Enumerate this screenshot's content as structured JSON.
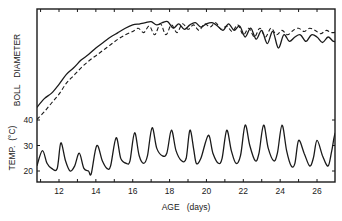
{
  "chart_data": {
    "type": "line",
    "title": "",
    "xlabel": "AGE (days)",
    "ylabel_upper": "BOLL DIAMETER",
    "ylabel_lower": "TEMP. (°C)",
    "xlim": [
      10.8,
      27.2
    ],
    "x_ticks": [
      12,
      14,
      16,
      18,
      20,
      22,
      24,
      26
    ],
    "y_ticks_temp": [
      20,
      30,
      40
    ],
    "grid": false,
    "legend": "none",
    "series": [
      {
        "name": "Boll diameter (solid)",
        "style": "solid",
        "units": "relative (unlabeled axis, 0-1 of upper panel)",
        "x": [
          10.8,
          11.2,
          11.6,
          12.0,
          12.4,
          12.8,
          13.2,
          13.6,
          14.0,
          14.4,
          14.8,
          15.2,
          15.6,
          16.0,
          16.4,
          16.7,
          17.0,
          17.3,
          17.6,
          17.9,
          18.2,
          18.5,
          18.8,
          19.1,
          19.4,
          19.7,
          20.0,
          20.3,
          20.6,
          20.9,
          21.2,
          21.5,
          21.8,
          22.1,
          22.4,
          22.7,
          23.0,
          23.3,
          23.6,
          23.9,
          24.2,
          24.5,
          24.8,
          25.1,
          25.4,
          25.7,
          26.0,
          26.3,
          26.6,
          26.9,
          27.2
        ],
        "y": [
          0.16,
          0.24,
          0.29,
          0.37,
          0.46,
          0.52,
          0.59,
          0.64,
          0.7,
          0.75,
          0.8,
          0.84,
          0.88,
          0.91,
          0.92,
          0.93,
          0.94,
          0.91,
          0.93,
          0.94,
          0.88,
          0.92,
          0.87,
          0.91,
          0.93,
          0.89,
          0.92,
          0.93,
          0.9,
          0.86,
          0.92,
          0.86,
          0.9,
          0.8,
          0.88,
          0.78,
          0.86,
          0.74,
          0.85,
          0.7,
          0.82,
          0.76,
          0.8,
          0.82,
          0.76,
          0.82,
          0.8,
          0.75,
          0.8,
          0.76,
          0.77
        ]
      },
      {
        "name": "Boll diameter (dashed)",
        "style": "dashed",
        "units": "relative (unlabeled axis, 0-1 of upper panel)",
        "x": [
          10.8,
          11.2,
          11.6,
          12.0,
          12.4,
          12.8,
          13.2,
          13.6,
          14.0,
          14.4,
          14.8,
          15.2,
          15.6,
          16.0,
          16.3,
          16.6,
          16.9,
          17.2,
          17.5,
          17.8,
          18.1,
          18.4,
          18.7,
          19.0,
          19.3,
          19.6,
          19.9,
          20.2,
          20.5,
          20.8,
          21.1,
          21.4,
          21.7,
          22.0,
          22.3,
          22.6,
          22.9,
          23.2,
          23.5,
          23.8,
          24.1,
          24.4,
          24.7,
          25.0,
          25.3,
          25.6,
          25.9,
          26.2,
          26.5,
          26.8,
          27.2
        ],
        "y": [
          0.05,
          0.12,
          0.2,
          0.28,
          0.38,
          0.45,
          0.52,
          0.58,
          0.63,
          0.68,
          0.73,
          0.78,
          0.82,
          0.85,
          0.88,
          0.84,
          0.9,
          0.82,
          0.92,
          0.82,
          0.91,
          0.84,
          0.92,
          0.87,
          0.91,
          0.86,
          0.92,
          0.89,
          0.93,
          0.87,
          0.9,
          0.85,
          0.91,
          0.82,
          0.88,
          0.8,
          0.88,
          0.8,
          0.88,
          0.82,
          0.86,
          0.82,
          0.86,
          0.88,
          0.85,
          0.88,
          0.86,
          0.83,
          0.86,
          0.84,
          0.85
        ]
      },
      {
        "name": "Temperature",
        "style": "solid",
        "units": "°C",
        "x": [
          10.8,
          11.1,
          11.35,
          11.6,
          11.9,
          12.1,
          12.35,
          12.6,
          12.85,
          13.1,
          13.35,
          13.6,
          13.75,
          14.05,
          14.35,
          14.6,
          14.8,
          15.1,
          15.35,
          15.65,
          15.85,
          16.1,
          16.35,
          16.6,
          16.8,
          17.05,
          17.3,
          17.6,
          17.85,
          18.1,
          18.35,
          18.65,
          18.9,
          19.1,
          19.3,
          19.45,
          19.7,
          20.1,
          20.35,
          20.65,
          20.85,
          21.1,
          21.35,
          21.6,
          21.85,
          22.1,
          22.35,
          22.65,
          22.85,
          23.1,
          23.35,
          23.65,
          23.85,
          24.1,
          24.35,
          24.6,
          24.8,
          25.0,
          25.3,
          25.6,
          25.8,
          26.0,
          26.3,
          26.6,
          26.8,
          27.0,
          27.2
        ],
        "y": [
          22,
          28,
          23,
          21,
          21,
          31,
          24,
          20,
          22,
          27,
          21,
          20,
          19,
          30,
          24,
          21,
          22,
          33,
          25,
          23,
          24,
          35,
          26,
          23,
          26,
          37,
          29,
          26,
          27,
          36,
          28,
          24,
          25,
          36,
          29,
          23,
          25,
          34,
          27,
          23,
          25,
          36,
          28,
          23,
          26,
          38,
          30,
          24,
          27,
          38,
          29,
          24,
          27,
          38,
          28,
          22,
          23,
          32,
          27,
          22,
          25,
          32,
          26,
          22,
          28,
          35,
          30
        ]
      }
    ]
  },
  "labels": {
    "x_axis": "AGE   (days)",
    "y_upper": "BOLL   DIAMETER",
    "y_lower": "TEMP.  (°C)"
  }
}
